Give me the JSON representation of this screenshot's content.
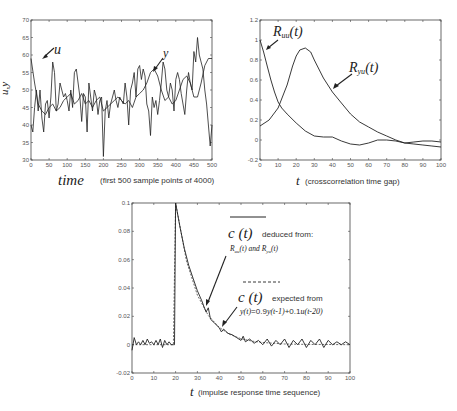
{
  "chart_data": [
    {
      "id": "top-left",
      "type": "line",
      "title": "",
      "xlabel_main": "time",
      "xlabel_note": "(first 500 sample points of 4000)",
      "ylabel": "u,y",
      "xlim": [
        0,
        500
      ],
      "ylim": [
        30,
        70
      ],
      "xticks": [
        0,
        50,
        100,
        150,
        200,
        250,
        300,
        350,
        400,
        450,
        500
      ],
      "yticks": [
        30,
        35,
        40,
        45,
        50,
        55,
        60,
        65,
        70
      ],
      "grid": false,
      "annotations": [
        {
          "text": "u",
          "x": 60,
          "y": 57
        },
        {
          "text": "y",
          "x": 345,
          "y": 55
        }
      ],
      "series": [
        {
          "name": "u",
          "x": [
            0,
            5,
            10,
            15,
            20,
            25,
            30,
            35,
            40,
            45,
            50,
            55,
            60,
            65,
            70,
            75,
            80,
            85,
            90,
            95,
            100,
            105,
            110,
            115,
            120,
            125,
            130,
            135,
            140,
            145,
            150,
            155,
            160,
            165,
            170,
            175,
            180,
            185,
            190,
            195,
            200,
            205,
            210,
            215,
            220,
            225,
            230,
            235,
            240,
            245,
            250,
            255,
            260,
            265,
            270,
            275,
            280,
            285,
            290,
            295,
            300,
            305,
            310,
            315,
            320,
            325,
            330,
            335,
            340,
            345,
            350,
            355,
            360,
            365,
            370,
            375,
            380,
            385,
            390,
            395,
            400,
            405,
            410,
            415,
            420,
            425,
            430,
            435,
            440,
            445,
            450,
            455,
            460,
            465,
            470,
            475,
            480,
            485,
            490,
            495,
            500
          ],
          "values": [
            40,
            38,
            45,
            50,
            44,
            50,
            42,
            38,
            46,
            47,
            42,
            48,
            58,
            55,
            44,
            46,
            52,
            50,
            48,
            49,
            47,
            44,
            50,
            45,
            55,
            56,
            52,
            48,
            41,
            49,
            48,
            38,
            52,
            48,
            44,
            50,
            48,
            43,
            47,
            48,
            31,
            44,
            47,
            42,
            46,
            48,
            50,
            47,
            45,
            48,
            47,
            46,
            52,
            48,
            40,
            50,
            52,
            55,
            48,
            56,
            57,
            53,
            56,
            54,
            46,
            44,
            37,
            48,
            45,
            47,
            43,
            47,
            52,
            58,
            56,
            50,
            48,
            52,
            50,
            44,
            53,
            55,
            53,
            49,
            46,
            43,
            50,
            55,
            52,
            50,
            61,
            58,
            65,
            60,
            58,
            56,
            50,
            46,
            40,
            34,
            40
          ]
        },
        {
          "name": "y",
          "x": [
            0,
            10,
            20,
            30,
            40,
            50,
            60,
            70,
            80,
            90,
            100,
            110,
            120,
            130,
            140,
            150,
            160,
            170,
            180,
            190,
            200,
            210,
            220,
            230,
            240,
            250,
            260,
            270,
            280,
            290,
            300,
            310,
            320,
            330,
            340,
            350,
            360,
            370,
            380,
            390,
            400,
            410,
            420,
            430,
            440,
            450,
            460,
            470,
            480,
            490,
            500
          ],
          "values": [
            59,
            52,
            46,
            44,
            43,
            45,
            46,
            44,
            45,
            47,
            48,
            49,
            46,
            47,
            49,
            46,
            47,
            45,
            47,
            48,
            44,
            45,
            46,
            47,
            48,
            47,
            46,
            47,
            45,
            48,
            49,
            50,
            52,
            55,
            56,
            54,
            50,
            47,
            48,
            46,
            47,
            50,
            53,
            54,
            52,
            48,
            48,
            52,
            57,
            59,
            59
          ]
        }
      ]
    },
    {
      "id": "top-right",
      "type": "line",
      "title": "",
      "xlabel_main": "t",
      "xlabel_note": "(crosscorrelation time gap)",
      "ylabel": "",
      "xlim": [
        0,
        100
      ],
      "ylim": [
        -0.2,
        1.2
      ],
      "xticks": [
        0,
        10,
        20,
        30,
        40,
        50,
        60,
        70,
        80,
        90,
        100
      ],
      "yticks": [
        -0.2,
        0,
        0.2,
        0.4,
        0.6,
        0.8,
        1,
        1.2
      ],
      "ytick_labels": [
        "-0.2",
        "0",
        "0.2",
        "0.4",
        "0.6",
        "0.8",
        "1",
        "1.2"
      ],
      "grid": false,
      "annotations": [
        {
          "text": "R_uu(t)",
          "x": 8,
          "y": 1.08
        },
        {
          "text": "R_yu(t)",
          "x": 60,
          "y": 0.73
        }
      ],
      "series": [
        {
          "name": "R_uu(t)",
          "x": [
            0,
            2,
            4,
            6,
            8,
            10,
            12,
            15,
            20,
            25,
            30,
            35,
            40,
            45,
            50,
            55,
            60,
            65,
            70,
            75,
            80,
            85,
            90,
            95,
            100
          ],
          "values": [
            1.0,
            0.88,
            0.74,
            0.6,
            0.48,
            0.38,
            0.32,
            0.26,
            0.17,
            0.09,
            0.04,
            0.03,
            0.03,
            -0.01,
            -0.04,
            -0.05,
            -0.03,
            0.0,
            0.0,
            -0.01,
            -0.03,
            -0.02,
            -0.01,
            -0.01,
            -0.02
          ]
        },
        {
          "name": "R_yu(t)",
          "x": [
            0,
            5,
            10,
            15,
            18,
            20,
            22,
            25,
            28,
            30,
            35,
            40,
            45,
            50,
            55,
            60,
            65,
            70,
            75,
            80,
            85,
            90,
            95,
            100
          ],
          "values": [
            0.14,
            0.2,
            0.32,
            0.55,
            0.74,
            0.84,
            0.9,
            0.92,
            0.88,
            0.8,
            0.62,
            0.48,
            0.37,
            0.26,
            0.18,
            0.13,
            0.08,
            0.04,
            0.0,
            -0.03,
            -0.04,
            -0.05,
            -0.06,
            -0.07
          ]
        }
      ]
    },
    {
      "id": "bottom",
      "type": "line",
      "title": "",
      "xlabel_main": "t",
      "xlabel_note": "(impulse response time sequence)",
      "ylabel": "",
      "xlim": [
        0,
        100
      ],
      "ylim": [
        -0.02,
        0.1
      ],
      "xticks": [
        0,
        10,
        20,
        30,
        40,
        50,
        60,
        70,
        80,
        90,
        100
      ],
      "yticks": [
        -0.02,
        0,
        0.02,
        0.04,
        0.06,
        0.08,
        0.1
      ],
      "ytick_labels": [
        "-0.02",
        "0",
        "0.02",
        "0.04",
        "0.06",
        "0.08",
        "0.1"
      ],
      "grid": false,
      "legend": [
        {
          "style": "solid",
          "label_symbol": "c (t)",
          "label": "deduced from:",
          "sublabel": "R_uu(t) and R_yu(t)"
        },
        {
          "style": "dashed",
          "label_symbol": "c (t)",
          "label": "expected from",
          "sublabel": "y(t)=0.9y(t-1)+0.1u(t-20)"
        }
      ],
      "series": [
        {
          "name": "c(t) deduced",
          "x": [
            0,
            1,
            2,
            3,
            4,
            5,
            6,
            7,
            8,
            9,
            10,
            11,
            12,
            13,
            14,
            15,
            16,
            17,
            18,
            19,
            19.5,
            20,
            22,
            24,
            26,
            28,
            30,
            32,
            33,
            34,
            35,
            36,
            38,
            40,
            41,
            42,
            44,
            46,
            48,
            50,
            51,
            52,
            54,
            56,
            58,
            60,
            62,
            64,
            66,
            68,
            70,
            72,
            74,
            76,
            78,
            80,
            82,
            84,
            86,
            88,
            90,
            92,
            94,
            96,
            98,
            100
          ],
          "values": [
            -0.004,
            0.005,
            0.0,
            0.002,
            0.0,
            0.003,
            0.0,
            0.004,
            0.001,
            0.002,
            0.0,
            0.003,
            0.0,
            0.004,
            -0.002,
            0.003,
            0.0,
            0.002,
            0.0,
            0.0,
            0.0,
            0.1,
            0.083,
            0.068,
            0.056,
            0.047,
            0.038,
            0.031,
            0.027,
            0.023,
            0.026,
            0.018,
            0.015,
            0.012,
            0.009,
            0.011,
            0.008,
            0.007,
            0.005,
            0.003,
            0.006,
            0.002,
            0.004,
            0.001,
            0.003,
            0.0,
            0.004,
            -0.001,
            0.003,
            0.0,
            0.004,
            -0.002,
            0.003,
            0.0,
            0.004,
            -0.002,
            0.003,
            0.0,
            0.004,
            -0.002,
            0.003,
            0.0,
            0.002,
            0.0,
            0.002,
            0.0
          ]
        },
        {
          "name": "c(t) expected",
          "x": [
            0,
            19,
            20,
            25,
            30,
            35,
            40,
            45,
            50,
            55,
            60,
            70,
            80,
            90,
            100
          ],
          "values": [
            0,
            0,
            0.1,
            0.059,
            0.0349,
            0.0206,
            0.0122,
            0.0072,
            0.0042,
            0.0025,
            0.0015,
            0.0005,
            0.0002,
            0.0001,
            0.0
          ]
        }
      ]
    }
  ],
  "labels": {
    "tl_time": "time",
    "tl_note": "(first 500 sample points of 4000)",
    "tl_ylabel": "u,y",
    "tl_u": "u",
    "tl_y": "y",
    "tr_t": "t",
    "tr_note": "(crosscorrelation time gap)",
    "tr_R": "R",
    "tr_uu": "uu",
    "tr_yu": "yu",
    "tr_arg": "(t)",
    "b_t": "t",
    "b_note": "(impulse response time sequence)",
    "b_c": "c (t)",
    "b_deduced": "deduced from:",
    "b_deduced_sub": "R",
    "b_uu": "uu",
    "b_and": "(t) and R",
    "b_yu": "yu",
    "b_arg": "(t)",
    "b_expected": "expected from",
    "b_eq_a": "y(t)",
    "b_eq_b": "=0.9",
    "b_eq_c": "y(t-1)",
    "b_eq_d": "+0.1",
    "b_eq_e": "u(t-20)"
  },
  "colors": {
    "line": "#222222",
    "axis": "#444444",
    "tick_text": "#555555"
  }
}
